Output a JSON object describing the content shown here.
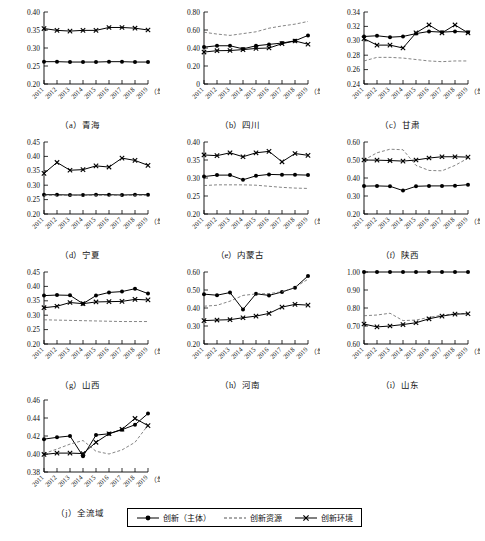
{
  "figure": {
    "x_axis_unit_label": "（年份）",
    "years": [
      "2011",
      "2012",
      "2013",
      "2014",
      "2015",
      "2016",
      "2017",
      "2018",
      "2019"
    ],
    "legend": {
      "items": [
        {
          "name": "innovation-subject",
          "label": "创新（主体）",
          "style": "solid-circle",
          "color": "#000000"
        },
        {
          "name": "innovation-resource",
          "label": "创新资源",
          "style": "dashed",
          "color": "#555555"
        },
        {
          "name": "innovation-environment",
          "label": "创新环境",
          "style": "solid-cross",
          "color": "#000000"
        }
      ]
    }
  },
  "chart_data": [
    {
      "id": "a",
      "type": "line",
      "title": "（a）青海",
      "xlabel": "（年份）",
      "ylabel": "",
      "x": [
        "2011",
        "2012",
        "2013",
        "2014",
        "2015",
        "2016",
        "2017",
        "2018",
        "2019"
      ],
      "ylim": [
        0.2,
        0.4
      ],
      "yticks": [
        0.2,
        0.25,
        0.3,
        0.35,
        0.4
      ],
      "ytick_labels": [
        "0.20",
        "0.25",
        "0.30",
        "0.35",
        "0.40"
      ],
      "grid": false,
      "series": [
        {
          "name": "创新（主体）",
          "values": [
            0.262,
            0.262,
            0.261,
            0.261,
            0.261,
            0.262,
            0.262,
            0.261,
            0.261
          ]
        },
        {
          "name": "创新资源",
          "values": [
            null,
            null,
            null,
            null,
            null,
            null,
            null,
            null,
            null
          ]
        },
        {
          "name": "创新环境",
          "values": [
            0.354,
            0.349,
            0.347,
            0.349,
            0.349,
            0.357,
            0.357,
            0.355,
            0.35
          ]
        }
      ]
    },
    {
      "id": "b",
      "type": "line",
      "title": "（b）四川",
      "xlabel": "（年份）",
      "ylabel": "",
      "x": [
        "2011",
        "2012",
        "2013",
        "2014",
        "2015",
        "2016",
        "2017",
        "2018",
        "2019"
      ],
      "ylim": [
        0.0,
        0.8
      ],
      "yticks": [
        0.0,
        0.2,
        0.4,
        0.6,
        0.8
      ],
      "ytick_labels": [
        "0",
        "0.20",
        "0.40",
        "0.60",
        "0.80"
      ],
      "grid": false,
      "series": [
        {
          "name": "创新（主体）",
          "values": [
            0.41,
            0.425,
            0.425,
            0.39,
            0.425,
            0.44,
            0.455,
            0.48,
            0.54
          ]
        },
        {
          "name": "创新资源",
          "values": [
            0.575,
            0.555,
            0.54,
            0.56,
            0.58,
            0.62,
            0.645,
            0.665,
            0.695
          ]
        },
        {
          "name": "创新环境",
          "values": [
            0.355,
            0.37,
            0.372,
            0.382,
            0.395,
            0.4,
            0.448,
            0.478,
            0.442
          ]
        }
      ]
    },
    {
      "id": "c",
      "type": "line",
      "title": "（c）甘肃",
      "xlabel": "（年份）",
      "ylabel": "",
      "x": [
        "2011",
        "2012",
        "2013",
        "2014",
        "2015",
        "2016",
        "2017",
        "2018",
        "2019"
      ],
      "ylim": [
        0.24,
        0.34
      ],
      "yticks": [
        0.24,
        0.26,
        0.28,
        0.3,
        0.32,
        0.34
      ],
      "ytick_labels": [
        "0.24",
        "0.26",
        "0.28",
        "0.30",
        "0.32",
        "0.34"
      ],
      "grid": false,
      "series": [
        {
          "name": "创新（主体）",
          "values": [
            0.306,
            0.307,
            0.305,
            0.306,
            0.31,
            0.313,
            0.312,
            0.313,
            0.312
          ]
        },
        {
          "name": "创新资源",
          "values": [
            0.272,
            0.277,
            0.277,
            0.276,
            0.274,
            0.272,
            0.271,
            0.272,
            0.272
          ]
        },
        {
          "name": "创新环境",
          "values": [
            0.303,
            0.294,
            0.294,
            0.29,
            0.311,
            0.322,
            0.311,
            0.322,
            0.311
          ]
        }
      ]
    },
    {
      "id": "d",
      "type": "line",
      "title": "（d）宁夏",
      "xlabel": "（年份）",
      "ylabel": "",
      "x": [
        "2011",
        "2012",
        "2013",
        "2014",
        "2015",
        "2016",
        "2017",
        "2018",
        "2019"
      ],
      "ylim": [
        0.2,
        0.45
      ],
      "yticks": [
        0.2,
        0.25,
        0.3,
        0.35,
        0.4,
        0.45
      ],
      "ytick_labels": [
        "0.20",
        "0.25",
        "0.30",
        "0.35",
        "0.40",
        "0.45"
      ],
      "grid": false,
      "series": [
        {
          "name": "创新（主体）",
          "values": [
            0.267,
            0.267,
            0.266,
            0.266,
            0.267,
            0.267,
            0.266,
            0.267,
            0.267
          ]
        },
        {
          "name": "创新资源",
          "values": [
            0.265,
            0.265,
            0.265,
            0.265,
            0.265,
            0.265,
            0.265,
            0.265,
            0.265
          ]
        },
        {
          "name": "创新环境",
          "values": [
            0.341,
            0.379,
            0.352,
            0.354,
            0.367,
            0.363,
            0.394,
            0.386,
            0.369
          ]
        }
      ]
    },
    {
      "id": "e",
      "type": "line",
      "title": "（e）内蒙古",
      "xlabel": "（年份）",
      "ylabel": "",
      "x": [
        "2011",
        "2012",
        "2013",
        "2014",
        "2015",
        "2016",
        "2017",
        "2018",
        "2019"
      ],
      "ylim": [
        0.2,
        0.4
      ],
      "yticks": [
        0.2,
        0.25,
        0.3,
        0.35,
        0.4
      ],
      "ytick_labels": [
        "0.20",
        "0.25",
        "0.30",
        "0.35",
        "0.40"
      ],
      "grid": false,
      "series": [
        {
          "name": "创新（主体）",
          "values": [
            0.304,
            0.308,
            0.308,
            0.295,
            0.306,
            0.31,
            0.309,
            0.309,
            0.308
          ]
        },
        {
          "name": "创新资源",
          "values": [
            0.279,
            0.281,
            0.281,
            0.281,
            0.28,
            0.277,
            0.274,
            0.272,
            0.271
          ]
        },
        {
          "name": "创新环境",
          "values": [
            0.364,
            0.362,
            0.37,
            0.359,
            0.37,
            0.374,
            0.345,
            0.368,
            0.363
          ]
        }
      ]
    },
    {
      "id": "f",
      "type": "line",
      "title": "（f）陕西",
      "xlabel": "（年份）",
      "ylabel": "",
      "x": [
        "2011",
        "2012",
        "2013",
        "2014",
        "2015",
        "2016",
        "2017",
        "2018",
        "2019"
      ],
      "ylim": [
        0.2,
        0.6
      ],
      "yticks": [
        0.2,
        0.3,
        0.4,
        0.5,
        0.6
      ],
      "ytick_labels": [
        "0.20",
        "0.30",
        "0.40",
        "0.50",
        "0.60"
      ],
      "grid": false,
      "series": [
        {
          "name": "创新（主体）",
          "values": [
            0.355,
            0.356,
            0.354,
            0.33,
            0.354,
            0.356,
            0.356,
            0.357,
            0.363
          ]
        },
        {
          "name": "创新资源",
          "values": [
            0.5,
            0.54,
            0.56,
            0.557,
            0.47,
            0.442,
            0.44,
            0.47,
            0.51
          ]
        },
        {
          "name": "创新环境",
          "values": [
            0.5,
            0.499,
            0.497,
            0.494,
            0.5,
            0.511,
            0.518,
            0.518,
            0.516
          ]
        }
      ]
    },
    {
      "id": "g",
      "type": "line",
      "title": "（g）山西",
      "xlabel": "（年份）",
      "ylabel": "",
      "x": [
        "2011",
        "2012",
        "2013",
        "2014",
        "2015",
        "2016",
        "2017",
        "2018",
        "2019"
      ],
      "ylim": [
        0.2,
        0.45
      ],
      "yticks": [
        0.2,
        0.25,
        0.3,
        0.35,
        0.4,
        0.45
      ],
      "ytick_labels": [
        "0.20",
        "0.25",
        "0.30",
        "0.35",
        "0.40",
        "0.45"
      ],
      "grid": false,
      "series": [
        {
          "name": "创新（主体）",
          "values": [
            0.368,
            0.37,
            0.369,
            0.34,
            0.368,
            0.379,
            0.382,
            0.392,
            0.375
          ]
        },
        {
          "name": "创新资源",
          "values": [
            0.284,
            0.283,
            0.282,
            0.281,
            0.28,
            0.279,
            0.278,
            0.278,
            0.278
          ]
        },
        {
          "name": "创新环境",
          "values": [
            0.326,
            0.331,
            0.344,
            0.34,
            0.346,
            0.347,
            0.348,
            0.355,
            0.353
          ]
        }
      ]
    },
    {
      "id": "h",
      "type": "line",
      "title": "（h）河南",
      "xlabel": "（年份）",
      "ylabel": "",
      "x": [
        "2011",
        "2012",
        "2013",
        "2014",
        "2015",
        "2016",
        "2017",
        "2018",
        "2019"
      ],
      "ylim": [
        0.2,
        0.6
      ],
      "yticks": [
        0.2,
        0.3,
        0.4,
        0.5,
        0.6
      ],
      "ytick_labels": [
        "0.20",
        "0.30",
        "0.40",
        "0.50",
        "0.60"
      ],
      "grid": false,
      "series": [
        {
          "name": "创新（主体）",
          "values": [
            0.477,
            0.471,
            0.486,
            0.392,
            0.479,
            0.47,
            0.489,
            0.513,
            0.578
          ]
        },
        {
          "name": "创新资源",
          "values": [
            0.41,
            0.415,
            0.438,
            0.47,
            0.478,
            0.48,
            0.49,
            0.515,
            0.56
          ]
        },
        {
          "name": "创新环境",
          "values": [
            0.33,
            0.333,
            0.335,
            0.346,
            0.355,
            0.37,
            0.405,
            0.42,
            0.416
          ]
        }
      ]
    },
    {
      "id": "i",
      "type": "line",
      "title": "（i）山东",
      "xlabel": "（年份）",
      "ylabel": "",
      "x": [
        "2011",
        "2012",
        "2013",
        "2014",
        "2015",
        "2016",
        "2017",
        "2018",
        "2019"
      ],
      "ylim": [
        0.6,
        1.0
      ],
      "yticks": [
        0.6,
        0.7,
        0.8,
        0.9,
        1.0
      ],
      "ytick_labels": [
        "0.60",
        "0.70",
        "0.80",
        "0.90",
        "1.00"
      ],
      "grid": false,
      "series": [
        {
          "name": "创新（主体）",
          "values": [
            1.0,
            1.0,
            1.0,
            1.0,
            1.0,
            1.0,
            1.0,
            1.0,
            1.0
          ]
        },
        {
          "name": "创新资源",
          "values": [
            0.757,
            0.761,
            0.771,
            0.73,
            0.733,
            0.748,
            0.76,
            0.768,
            0.77
          ]
        },
        {
          "name": "创新环境",
          "values": [
            0.711,
            0.695,
            0.7,
            0.708,
            0.718,
            0.74,
            0.755,
            0.766,
            0.768
          ]
        }
      ]
    },
    {
      "id": "j",
      "type": "line",
      "title": "（j）全流域",
      "xlabel": "（年份）",
      "ylabel": "",
      "x": [
        "2011",
        "2012",
        "2013",
        "2014",
        "2015",
        "2016",
        "2017",
        "2018",
        "2019"
      ],
      "ylim": [
        0.38,
        0.46
      ],
      "yticks": [
        0.38,
        0.4,
        0.42,
        0.44,
        0.46
      ],
      "ytick_labels": [
        "0.38",
        "0.40",
        "0.42",
        "0.44",
        "0.46"
      ],
      "grid": false,
      "series": [
        {
          "name": "创新（主体）",
          "values": [
            0.4165,
            0.4185,
            0.42,
            0.3975,
            0.421,
            0.4225,
            0.427,
            0.4325,
            0.445
          ]
        },
        {
          "name": "创新资源",
          "values": [
            0.4005,
            0.4055,
            0.411,
            0.415,
            0.403,
            0.4,
            0.4045,
            0.413,
            0.432
          ]
        },
        {
          "name": "创新环境",
          "values": [
            0.3995,
            0.401,
            0.401,
            0.4005,
            0.413,
            0.4225,
            0.4275,
            0.4395,
            0.4315
          ]
        }
      ]
    }
  ]
}
